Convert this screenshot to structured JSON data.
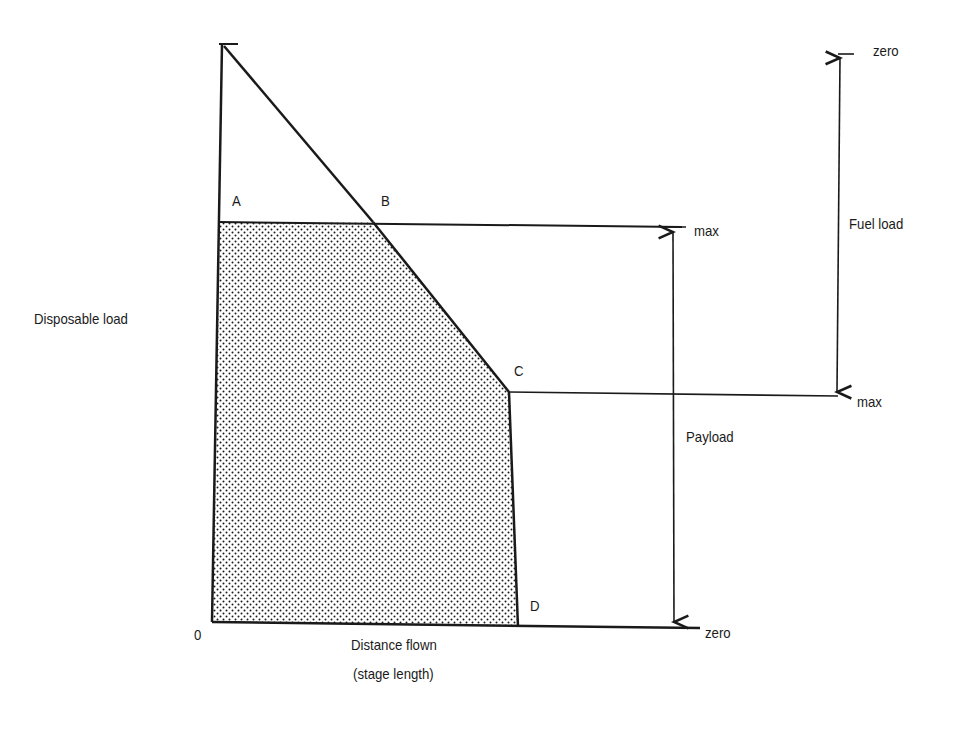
{
  "diagram": {
    "points": {
      "origin": "0",
      "A": "A",
      "B": "B",
      "C": "C",
      "D": "D"
    },
    "labels": {
      "y_axis": "Disposable load",
      "x_axis_line1": "Distance flown",
      "x_axis_line2": "(stage length)",
      "payload": "Payload",
      "fuel_load": "Fuel load",
      "payload_max": "max",
      "payload_zero": "zero",
      "fuel_zero": "zero",
      "fuel_max": "max"
    },
    "colors": {
      "ink": "#1a1a1a",
      "background": "#ffffff"
    }
  }
}
